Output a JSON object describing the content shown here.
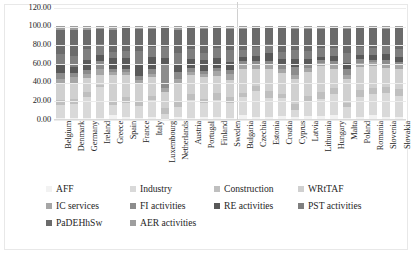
{
  "chart_data": {
    "type": "bar",
    "subtype": "100% stacked column",
    "title": "",
    "xlabel": "",
    "ylabel": "",
    "ylim": [
      0,
      120
    ],
    "ytick_labels": [
      "120.00",
      "100.00",
      "80.00",
      "60.00",
      "40.00",
      "20.00",
      "0.00"
    ],
    "ytick_values": [
      120,
      100,
      80,
      60,
      40,
      20,
      0
    ],
    "grid": true,
    "grid_orientation": "horizontal",
    "legend_position": "bottom",
    "group_divider_after_category": "Sweden",
    "categories": [
      "Belgium",
      "Denmark",
      "Germany",
      "Ireland",
      "Greece",
      "Spain",
      "France",
      "Italy",
      "Luxembourg",
      "Netherlands",
      "Austria",
      "Portugal",
      "Finland",
      "Sweden",
      "Bulgaria",
      "Czechia",
      "Estonia",
      "Croatia",
      "Cyprus",
      "Latvia",
      "Lithuania",
      "Hungary",
      "Malta",
      "Poland",
      "Romania",
      "Slovenia",
      "Slovakia"
    ],
    "series": [
      {
        "name": "AFF",
        "color": "#f2f2f2",
        "values": [
          0.7,
          1.2,
          0.8,
          1.0,
          4.1,
          2.6,
          1.6,
          2.0,
          0.3,
          1.8,
          1.2,
          2.3,
          2.6,
          1.3,
          4.2,
          2.1,
          2.6,
          3.5,
          2.0,
          3.6,
          3.3,
          3.8,
          1.0,
          2.6,
          4.3,
          2.0,
          2.6
        ]
      },
      {
        "name": "Industry",
        "color": "#d9d9d9",
        "values": [
          14.0,
          15.0,
          22.5,
          33.0,
          11.0,
          15.0,
          12.5,
          18.0,
          5.5,
          11.5,
          19.0,
          15.0,
          18.0,
          16.0,
          19.0,
          27.5,
          19.5,
          18.5,
          8.0,
          15.0,
          18.0,
          23.5,
          11.5,
          20.5,
          22.0,
          25.5,
          22.5
        ]
      },
      {
        "name": "Construction",
        "color": "#bfbfbf",
        "values": [
          5.5,
          5.5,
          5.5,
          2.5,
          4.0,
          6.0,
          5.5,
          4.5,
          6.0,
          5.0,
          6.5,
          4.5,
          7.0,
          6.5,
          4.5,
          6.0,
          7.5,
          4.5,
          6.5,
          6.0,
          7.5,
          5.5,
          5.0,
          7.5,
          7.0,
          6.5,
          7.0
        ]
      },
      {
        "name": "WRtTAF",
        "color": "#d0d0d0",
        "values": [
          18.5,
          17.0,
          15.5,
          11.0,
          28.0,
          23.5,
          17.5,
          20.5,
          17.5,
          19.5,
          20.0,
          23.0,
          18.0,
          17.5,
          26.0,
          18.5,
          24.0,
          23.0,
          26.5,
          26.0,
          27.5,
          21.0,
          24.5,
          25.5,
          23.0,
          21.0,
          22.0
        ]
      },
      {
        "name": "IC services",
        "color": "#a6a6a6",
        "values": [
          4.5,
          6.0,
          4.5,
          6.5,
          3.0,
          3.5,
          5.0,
          3.5,
          3.5,
          5.5,
          3.5,
          3.0,
          6.0,
          7.0,
          4.5,
          5.0,
          5.5,
          4.0,
          4.0,
          4.0,
          3.5,
          5.0,
          5.0,
          4.0,
          4.5,
          4.5,
          4.0
        ]
      },
      {
        "name": "FI activities",
        "color": "#8c8c8c",
        "values": [
          5.5,
          5.0,
          4.0,
          8.0,
          4.0,
          3.5,
          4.0,
          4.5,
          25.0,
          7.0,
          4.0,
          4.0,
          3.0,
          4.0,
          3.5,
          3.5,
          3.5,
          4.0,
          8.5,
          4.0,
          3.0,
          3.5,
          6.5,
          4.0,
          3.0,
          4.0,
          3.5
        ]
      },
      {
        "name": "RE activities",
        "color": "#595959",
        "values": [
          8.5,
          6.0,
          11.0,
          6.5,
          11.5,
          11.0,
          13.0,
          13.5,
          7.5,
          8.0,
          10.0,
          11.0,
          10.5,
          9.0,
          5.0,
          5.0,
          8.0,
          6.5,
          8.5,
          6.0,
          4.0,
          5.0,
          6.0,
          5.0,
          4.5,
          6.5,
          4.5
        ]
      },
      {
        "name": "PST activities",
        "color": "#7f7f7f",
        "values": [
          12.0,
          11.5,
          11.0,
          11.5,
          6.0,
          8.0,
          13.5,
          10.5,
          12.0,
          13.0,
          10.5,
          8.0,
          11.0,
          12.5,
          7.5,
          9.5,
          9.5,
          7.5,
          10.0,
          8.0,
          9.0,
          8.5,
          10.5,
          8.5,
          8.0,
          8.0,
          8.5
        ]
      },
      {
        "name": "PaDEHhSw",
        "color": "#6b6b6b",
        "values": [
          26.0,
          28.5,
          21.0,
          17.0,
          24.0,
          24.0,
          24.0,
          19.5,
          20.0,
          24.5,
          22.5,
          26.0,
          21.5,
          22.5,
          22.5,
          20.0,
          17.0,
          26.0,
          22.5,
          23.5,
          21.0,
          21.5,
          26.0,
          20.0,
          21.0,
          19.0,
          23.0
        ]
      },
      {
        "name": "AER activities",
        "color": "#9e9e9e",
        "values": [
          4.3,
          4.3,
          4.2,
          3.0,
          4.4,
          2.9,
          3.4,
          3.0,
          2.7,
          4.2,
          2.8,
          3.2,
          2.4,
          3.7,
          3.3,
          2.9,
          2.9,
          2.5,
          3.5,
          3.9,
          3.2,
          2.7,
          3.0,
          2.4,
          2.7,
          3.0,
          2.4
        ]
      }
    ]
  },
  "legend_rows": [
    [
      {
        "label": "AFF",
        "swatch": "#f2f2f2"
      },
      {
        "label": "Industry",
        "swatch": "#d9d9d9"
      },
      {
        "label": "Construction",
        "swatch": "#bfbfbf"
      },
      {
        "label": "WRtTAF",
        "swatch": "#d0d0d0"
      }
    ],
    [
      {
        "label": "IC services",
        "swatch": "#a6a6a6"
      },
      {
        "label": "FI activities",
        "swatch": "#8c8c8c"
      },
      {
        "label": "RE activities",
        "swatch": "#595959"
      },
      {
        "label": "PST activities",
        "swatch": "#7f7f7f"
      }
    ],
    [
      {
        "label": "PaDEHhSw",
        "swatch": "#6b6b6b"
      },
      {
        "label": "AER activities",
        "swatch": "#9e9e9e"
      }
    ]
  ],
  "legend_column_offsets_px": [
    0,
    84,
    168,
    252
  ]
}
